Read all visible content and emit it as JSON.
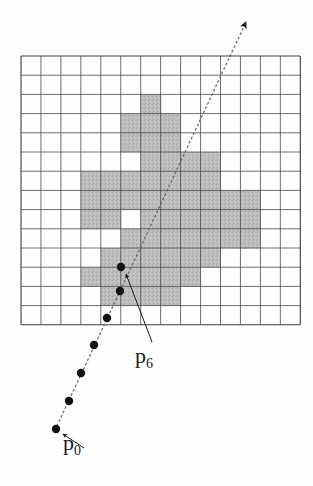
{
  "figure": {
    "type": "grid-raster-diagram",
    "title": "",
    "background_color": "#fefefe",
    "grid": {
      "name": "pixel-grid",
      "origin_x": 21,
      "origin_y": 56,
      "cols": 14,
      "rows": 14,
      "cell_width": 19.95,
      "cell_height": 19.2,
      "line_color": "#4a4a4a",
      "line_width": 0.8,
      "border_color": "#3a3a3a",
      "border_width": 1.1
    },
    "shaded_cells": {
      "name": "shaded-region",
      "fill_color": "#b9b9b9",
      "stroke_color": "#4a4a4a",
      "description": "Irregular blob of shaded grid cells representing an object region",
      "cells": [
        [
          6,
          2
        ],
        [
          5,
          3
        ],
        [
          6,
          3
        ],
        [
          7,
          3
        ],
        [
          5,
          4
        ],
        [
          6,
          4
        ],
        [
          7,
          4
        ],
        [
          6,
          5
        ],
        [
          7,
          5
        ],
        [
          8,
          5
        ],
        [
          9,
          5
        ],
        [
          3,
          6
        ],
        [
          4,
          6
        ],
        [
          5,
          6
        ],
        [
          6,
          6
        ],
        [
          7,
          6
        ],
        [
          8,
          6
        ],
        [
          9,
          6
        ],
        [
          3,
          7
        ],
        [
          4,
          7
        ],
        [
          5,
          7
        ],
        [
          6,
          7
        ],
        [
          7,
          7
        ],
        [
          8,
          7
        ],
        [
          9,
          7
        ],
        [
          10,
          7
        ],
        [
          11,
          7
        ],
        [
          3,
          8
        ],
        [
          4,
          8
        ],
        [
          6,
          8
        ],
        [
          7,
          8
        ],
        [
          8,
          8
        ],
        [
          9,
          8
        ],
        [
          10,
          8
        ],
        [
          11,
          8
        ],
        [
          5,
          9
        ],
        [
          6,
          9
        ],
        [
          7,
          9
        ],
        [
          8,
          9
        ],
        [
          9,
          9
        ],
        [
          10,
          9
        ],
        [
          11,
          9
        ],
        [
          4,
          10
        ],
        [
          5,
          10
        ],
        [
          6,
          10
        ],
        [
          7,
          10
        ],
        [
          8,
          10
        ],
        [
          9,
          10
        ],
        [
          3,
          11
        ],
        [
          4,
          11
        ],
        [
          5,
          11
        ],
        [
          6,
          11
        ],
        [
          7,
          11
        ],
        [
          8,
          11
        ],
        [
          4,
          12
        ],
        [
          5,
          12
        ],
        [
          6,
          12
        ],
        [
          7,
          12
        ]
      ]
    },
    "ray": {
      "name": "dotted-ray",
      "description": "Dotted ray traversing the grid from lower-left to upper-right with sample points",
      "start_x": 55,
      "start_y": 430,
      "end_x": 246,
      "end_y": 22,
      "color": "#6a6a6a",
      "dash": "1.6 3.2",
      "width": 1.3,
      "arrowhead": {
        "name": "ray-arrowhead",
        "x": 246,
        "y": 22,
        "color": "#1a1a1a"
      }
    },
    "sample_points": {
      "name": "sample-point-series",
      "color": "#111111",
      "radius": 4.2,
      "count": 7,
      "points": [
        {
          "label": "p0",
          "x": 56,
          "y": 429
        },
        {
          "label": "p1",
          "x": 69,
          "y": 401
        },
        {
          "label": "p2",
          "x": 81,
          "y": 373
        },
        {
          "label": "p3",
          "x": 94,
          "y": 345
        },
        {
          "label": "p4",
          "x": 107,
          "y": 318
        },
        {
          "label": "p5",
          "x": 120,
          "y": 291
        },
        {
          "label": "p6",
          "x": 121,
          "y": 267
        }
      ]
    },
    "annotations": [
      {
        "name": "p6-leader-line",
        "from_x": 152,
        "from_y": 342,
        "to_x": 126,
        "to_y": 274,
        "color": "#1a1a1a",
        "width": 1.0,
        "arrowhead": true
      },
      {
        "name": "p0-leader-line",
        "from_x": 84,
        "from_y": 448,
        "to_x": 63,
        "to_y": 434,
        "color": "#1a1a1a",
        "width": 1.0,
        "arrowhead": true
      }
    ],
    "labels": {
      "p6": {
        "base": "p",
        "sub": "6"
      },
      "p0": {
        "base": "p",
        "sub": "0"
      }
    }
  }
}
